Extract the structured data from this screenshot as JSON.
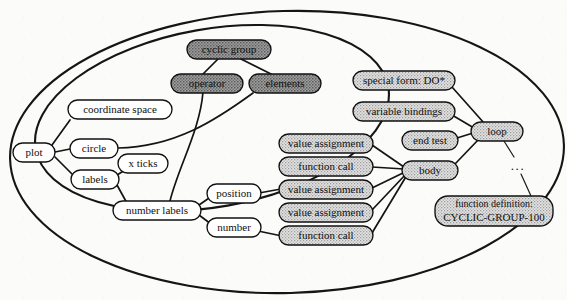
{
  "diagram": {
    "background": "#fbfbfb",
    "width": 567,
    "height": 300,
    "fills": {
      "white": "#ffffff",
      "light_stipple": "#d8d8d8",
      "dark_stipple": "#9a9a9a",
      "outline": "#101010"
    },
    "ellipsis_label": "...",
    "groups": [
      {
        "id": "outer-ellipse",
        "name": "outer-boundary-ellipse",
        "cx": 287,
        "cy": 152,
        "rx": 277,
        "ry": 141,
        "rotate": -2
      },
      {
        "id": "inner-ellipse",
        "name": "inner-boundary-ellipse",
        "cx": 212,
        "cy": 118,
        "rx": 178,
        "ry": 88,
        "rotate": -9
      }
    ],
    "nodes": [
      {
        "id": "cyclic-group",
        "label": "cyclic group",
        "x": 229,
        "y": 49,
        "w": 84,
        "h": 19,
        "fill": "dark"
      },
      {
        "id": "operator",
        "label": "operator",
        "x": 207,
        "y": 83,
        "w": 72,
        "h": 19,
        "fill": "dark"
      },
      {
        "id": "elements",
        "label": "elements",
        "x": 285,
        "y": 83,
        "w": 72,
        "h": 19,
        "fill": "dark"
      },
      {
        "id": "coordinate-space",
        "label": "coordinate space",
        "x": 120,
        "y": 110,
        "w": 104,
        "h": 19,
        "fill": "white"
      },
      {
        "id": "plot",
        "label": "plot",
        "x": 34,
        "y": 152,
        "w": 42,
        "h": 19,
        "fill": "white"
      },
      {
        "id": "circle",
        "label": "circle",
        "x": 94,
        "y": 148,
        "w": 48,
        "h": 19,
        "fill": "white"
      },
      {
        "id": "labels",
        "label": "labels",
        "x": 95,
        "y": 179,
        "w": 48,
        "h": 19,
        "fill": "white"
      },
      {
        "id": "x-ticks",
        "label": "x ticks",
        "x": 143,
        "y": 163,
        "w": 50,
        "h": 19,
        "fill": "white"
      },
      {
        "id": "number-labels",
        "label": "number labels",
        "x": 157,
        "y": 210,
        "w": 88,
        "h": 19,
        "fill": "white"
      },
      {
        "id": "position",
        "label": "position",
        "x": 234,
        "y": 193,
        "w": 54,
        "h": 19,
        "fill": "white"
      },
      {
        "id": "number",
        "label": "number",
        "x": 234,
        "y": 227,
        "w": 54,
        "h": 19,
        "fill": "white"
      },
      {
        "id": "va-1",
        "label": "value assignment",
        "x": 326,
        "y": 143,
        "w": 94,
        "h": 19,
        "fill": "light"
      },
      {
        "id": "fc-1",
        "label": "function call",
        "x": 326,
        "y": 166,
        "w": 94,
        "h": 19,
        "fill": "light"
      },
      {
        "id": "va-2",
        "label": "value assignment",
        "x": 326,
        "y": 189,
        "w": 94,
        "h": 19,
        "fill": "light"
      },
      {
        "id": "va-3",
        "label": "value assignment",
        "x": 326,
        "y": 212,
        "w": 94,
        "h": 19,
        "fill": "light"
      },
      {
        "id": "fc-2",
        "label": "function call",
        "x": 326,
        "y": 235,
        "w": 94,
        "h": 19,
        "fill": "light"
      },
      {
        "id": "special-form",
        "label": "special form: DO*",
        "x": 404,
        "y": 80,
        "w": 102,
        "h": 19,
        "fill": "light"
      },
      {
        "id": "var-bindings",
        "label": "variable bindings",
        "x": 404,
        "y": 111,
        "w": 102,
        "h": 19,
        "fill": "light"
      },
      {
        "id": "end-test",
        "label": "end test",
        "x": 430,
        "y": 140,
        "w": 56,
        "h": 19,
        "fill": "light"
      },
      {
        "id": "body",
        "label": "body",
        "x": 430,
        "y": 170,
        "w": 56,
        "h": 19,
        "fill": "light"
      },
      {
        "id": "loop",
        "label": "loop",
        "x": 497,
        "y": 131,
        "w": 52,
        "h": 19,
        "fill": "light"
      },
      {
        "id": "function-def",
        "label_line1": "function definition:",
        "label_line2": "CYCLIC-GROUP-100",
        "x": 494,
        "y": 211,
        "w": 118,
        "h": 30,
        "fill": "light"
      }
    ],
    "edges": [
      {
        "from": "cyclic-group",
        "to": "operator"
      },
      {
        "from": "cyclic-group",
        "to": "elements"
      },
      {
        "from": "plot",
        "to": "coordinate-space"
      },
      {
        "from": "plot",
        "to": "circle"
      },
      {
        "from": "plot",
        "to": "labels"
      },
      {
        "from": "labels",
        "to": "x-ticks"
      },
      {
        "from": "labels",
        "to": "number-labels"
      },
      {
        "from": "circle",
        "to": "elements"
      },
      {
        "from": "operator",
        "to": "number-labels"
      },
      {
        "from": "number-labels",
        "to": "position"
      },
      {
        "from": "number-labels",
        "to": "number"
      },
      {
        "from": "position",
        "to": "va-2"
      },
      {
        "from": "number",
        "to": "fc-2"
      },
      {
        "from": "va-1",
        "to": "body"
      },
      {
        "from": "fc-1",
        "to": "body"
      },
      {
        "from": "va-2",
        "to": "body"
      },
      {
        "from": "va-3",
        "to": "body"
      },
      {
        "from": "fc-2",
        "to": "body"
      },
      {
        "from": "special-form",
        "to": "loop"
      },
      {
        "from": "var-bindings",
        "to": "loop"
      },
      {
        "from": "end-test",
        "to": "loop"
      },
      {
        "from": "body",
        "to": "loop"
      },
      {
        "from": "loop",
        "to": "function-def",
        "style": "dotted-gap"
      }
    ]
  }
}
